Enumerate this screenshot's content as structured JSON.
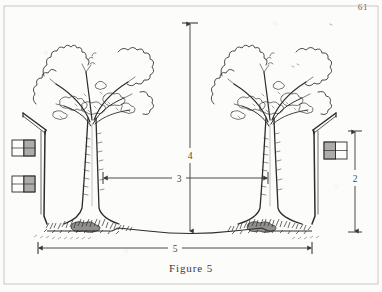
{
  "page": {
    "folio": "61",
    "caption": "Figure 5",
    "ink_color": "#2e2c2a",
    "paper_color": "#fcfcfb",
    "border_color": "#b9b7b2"
  },
  "figure": {
    "title": "Figure 5",
    "dimensions": [
      {
        "id": "vertical-height",
        "label": "4",
        "orientation": "vertical",
        "x": 190,
        "y_top": 22,
        "y_bottom": 232
      },
      {
        "id": "canopy-gap",
        "label": "3",
        "orientation": "horizontal",
        "y": 178,
        "x_left": 103,
        "x_right": 268
      },
      {
        "id": "building-height",
        "label": "2",
        "orientation": "vertical",
        "x": 355,
        "y_top": 131,
        "y_bottom": 232
      },
      {
        "id": "total-width",
        "label": "5",
        "orientation": "horizontal",
        "y": 248,
        "x_left": 38,
        "x_right": 312
      }
    ],
    "elements": [
      {
        "name": "left-building",
        "windows": 2,
        "roof": "sloped-eave"
      },
      {
        "name": "right-building",
        "windows": 1,
        "roof": "sloped-eave"
      },
      {
        "name": "left-tree",
        "style": "pen-and-ink",
        "canopy": "squiggle-outline"
      },
      {
        "name": "right-tree",
        "style": "pen-and-ink",
        "canopy": "squiggle-outline"
      },
      {
        "name": "ground-line",
        "style": "gently-curved-road-profile"
      }
    ]
  }
}
